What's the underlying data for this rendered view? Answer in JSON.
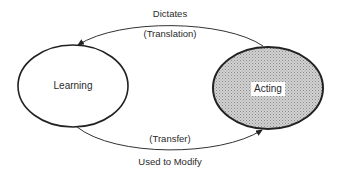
{
  "diagram": {
    "nodes": [
      {
        "id": "learning",
        "label": "Learning",
        "fill": "#ffffff",
        "shaded": false
      },
      {
        "id": "acting",
        "label": "Acting",
        "fill": "#c8c8c8",
        "shaded": true
      }
    ],
    "edges": [
      {
        "from": "acting",
        "to": "learning",
        "label_top": "Dictates",
        "label_bottom": "(Translation)"
      },
      {
        "from": "learning",
        "to": "acting",
        "label_top": "(Transfer)",
        "label_bottom": "Used to Modify"
      }
    ],
    "colors": {
      "stroke": "#222222",
      "shade": "#c8c8c8",
      "text": "#2a2a2a"
    }
  }
}
